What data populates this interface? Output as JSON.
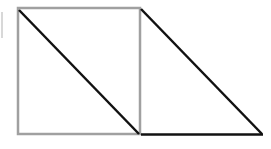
{
  "diagram": {
    "colors": {
      "square_outline": "#a0a0a0",
      "edge_dark": "#111111",
      "edge_mark": "#d8d8d8",
      "background": "#ffffff"
    },
    "shapes": [
      {
        "id": "square",
        "type": "rectangle",
        "x": 18,
        "y": 8,
        "width": 122,
        "height": 126,
        "stroke": "gray"
      },
      {
        "id": "square-diagonal",
        "type": "line",
        "from": [
          19,
          10
        ],
        "to": [
          139,
          134
        ],
        "stroke": "black"
      },
      {
        "id": "triangle-hypotenuse",
        "type": "line",
        "from": [
          141,
          9
        ],
        "to": [
          262,
          134
        ],
        "stroke": "black"
      },
      {
        "id": "triangle-base",
        "type": "line",
        "from": [
          141,
          134
        ],
        "to": [
          262,
          134
        ],
        "stroke": "black"
      }
    ]
  }
}
